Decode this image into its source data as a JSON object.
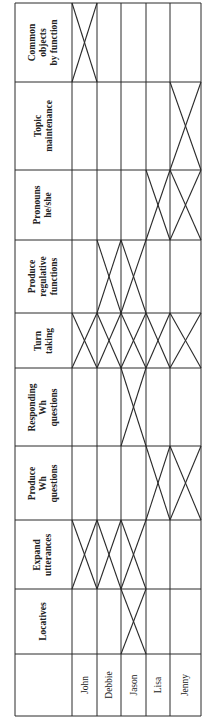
{
  "table": {
    "students": [
      "John",
      "Debbie",
      "Jason",
      "Lisa",
      "Jenny"
    ],
    "skills": [
      {
        "label": "Locatives",
        "marked": [
          false,
          false,
          true,
          false,
          false
        ]
      },
      {
        "label": "Expand\nutterances",
        "marked": [
          true,
          true,
          true,
          false,
          false
        ]
      },
      {
        "label": "Produce\nWh\nquestions",
        "marked": [
          false,
          false,
          false,
          true,
          true
        ]
      },
      {
        "label": "Responding\nWh\nquestions",
        "marked": [
          false,
          false,
          true,
          false,
          false
        ]
      },
      {
        "label": "Turn\ntaking",
        "marked": [
          true,
          true,
          true,
          true,
          true
        ]
      },
      {
        "label": "Produce\nregulative\nfunctions",
        "marked": [
          false,
          true,
          true,
          false,
          false
        ]
      },
      {
        "label": "Pronouns\nhe/she",
        "marked": [
          false,
          false,
          false,
          true,
          true
        ]
      },
      {
        "label": "Topic\nmaintenance",
        "marked": [
          false,
          false,
          false,
          false,
          true
        ]
      },
      {
        "label": "Common\nobjects\nby function",
        "marked": [
          true,
          false,
          false,
          false,
          false
        ]
      }
    ]
  },
  "style": {
    "line_color": "#2a2a2a"
  }
}
